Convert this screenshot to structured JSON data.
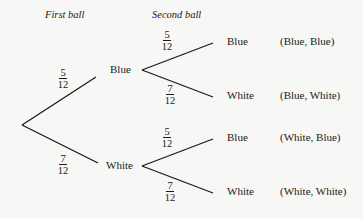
{
  "headers": {
    "first": "First ball",
    "second": "Second ball"
  },
  "root": {
    "branches": [
      {
        "label": "Blue",
        "prob": {
          "num": "5",
          "den": "12"
        },
        "children": [
          {
            "label": "Blue",
            "prob": {
              "num": "5",
              "den": "12"
            },
            "outcome": "(Blue, Blue)"
          },
          {
            "label": "White",
            "prob": {
              "num": "7",
              "den": "12"
            },
            "outcome": "(Blue, White)"
          }
        ]
      },
      {
        "label": "White",
        "prob": {
          "num": "7",
          "den": "12"
        },
        "children": [
          {
            "label": "Blue",
            "prob": {
              "num": "5",
              "den": "12"
            },
            "outcome": "(White, Blue)"
          },
          {
            "label": "White",
            "prob": {
              "num": "7",
              "den": "12"
            },
            "outcome": "(White, White)"
          }
        ]
      }
    ]
  },
  "colors": {
    "background": "#f7f7f5",
    "ink": "#1a1a1a"
  }
}
